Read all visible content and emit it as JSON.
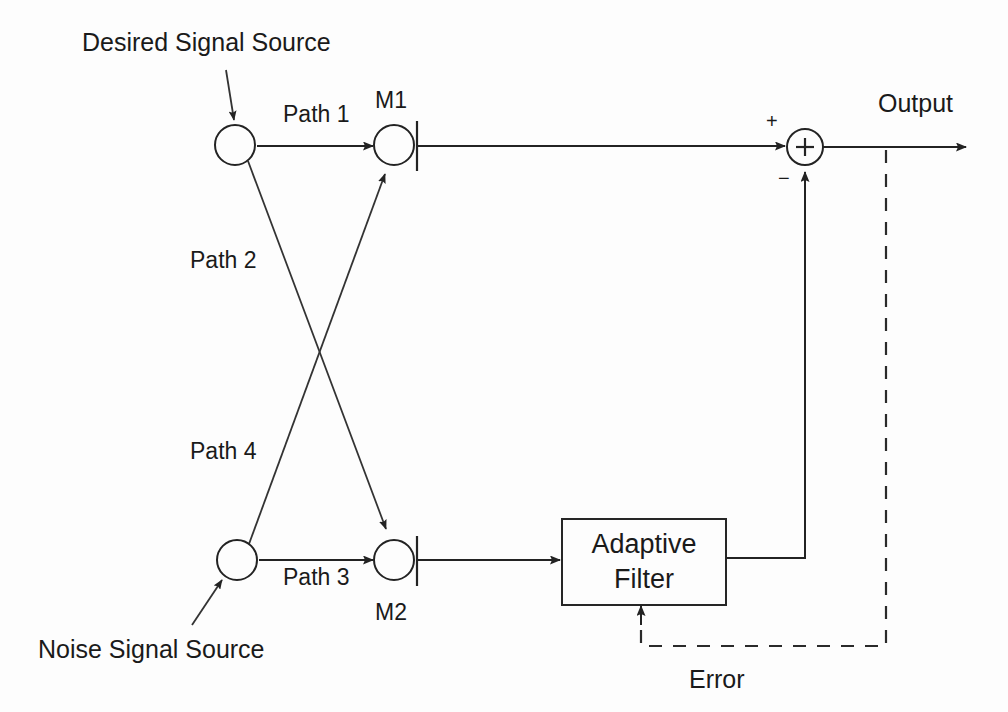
{
  "diagram": {
    "labels": {
      "desired_source": "Desired Signal Source",
      "noise_source": "Noise Signal Source",
      "path1": "Path 1",
      "path2": "Path 2",
      "path3": "Path 3",
      "path4": "Path 4",
      "mic1": "M1",
      "mic2": "M2",
      "adaptive_filter_line1": "Adaptive",
      "adaptive_filter_line2": "Filter",
      "output": "Output",
      "error": "Error",
      "sum_plus_input": "+",
      "sum_minus_input": "−",
      "sum_symbol": "+"
    },
    "colors": {
      "stroke": "#232323",
      "text": "#1a1a1a",
      "background": "#fdfdfd"
    },
    "nodes": [
      {
        "id": "desired-source-node",
        "label": "",
        "cx": 235,
        "cy": 145,
        "r": 20
      },
      {
        "id": "mic1-node",
        "label": "M1",
        "cx": 394,
        "cy": 145,
        "r": 20
      },
      {
        "id": "noise-source-node",
        "label": "",
        "cx": 237,
        "cy": 560,
        "r": 20
      },
      {
        "id": "mic2-node",
        "label": "M2",
        "cx": 394,
        "cy": 560,
        "r": 20
      },
      {
        "id": "summing-junction",
        "label": "+",
        "cx": 805,
        "cy": 147,
        "r": 18
      }
    ],
    "blocks": [
      {
        "id": "adaptive-filter-block",
        "x": 562,
        "y": 519,
        "width": 164,
        "height": 86
      }
    ],
    "connections": [
      {
        "id": "path1",
        "from": "desired-source-node",
        "to": "mic1-node",
        "label": "Path 1",
        "style": "solid"
      },
      {
        "id": "path2",
        "from": "desired-source-node",
        "to": "mic2-node",
        "label": "Path 2",
        "style": "solid"
      },
      {
        "id": "path3",
        "from": "noise-source-node",
        "to": "mic2-node",
        "label": "Path 3",
        "style": "solid"
      },
      {
        "id": "path4",
        "from": "noise-source-node",
        "to": "mic1-node",
        "label": "Path 4",
        "style": "solid"
      },
      {
        "id": "mic1-to-sum",
        "from": "mic1-node",
        "to": "summing-junction",
        "label": "",
        "style": "solid"
      },
      {
        "id": "mic2-to-filter",
        "from": "mic2-node",
        "to": "adaptive-filter-block",
        "label": "",
        "style": "solid"
      },
      {
        "id": "filter-to-sum",
        "from": "adaptive-filter-block",
        "to": "summing-junction",
        "label": "",
        "style": "solid"
      },
      {
        "id": "sum-to-output",
        "from": "summing-junction",
        "to": "output",
        "label": "Output",
        "style": "solid"
      },
      {
        "id": "error-feedback",
        "from": "output",
        "to": "adaptive-filter-block",
        "label": "Error",
        "style": "dashed"
      }
    ]
  }
}
